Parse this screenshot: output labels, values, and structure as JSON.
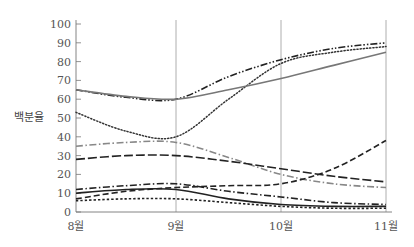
{
  "chart_data": {
    "type": "line",
    "title": "",
    "xlabel": "",
    "ylabel": "백분율",
    "categories": [
      "8월",
      "9월",
      "10월",
      "11월"
    ],
    "ylim": [
      0,
      100
    ],
    "yticks": [
      0,
      10,
      20,
      30,
      40,
      50,
      60,
      70,
      80,
      90,
      100
    ],
    "vertical_gridlines_at": [
      "9월",
      "10월",
      "11월"
    ],
    "legend": "none",
    "series": [
      {
        "name": "series-1",
        "style": "dash-dot-dot",
        "color": "#222222",
        "values": [
          65,
          60,
          81,
          90
        ],
        "mid": [
          [
            0.5,
            61
          ],
          [
            1.5,
            72
          ],
          [
            2.5,
            87
          ]
        ]
      },
      {
        "name": "series-2",
        "style": "dotted",
        "color": "#333333",
        "values": [
          53,
          40,
          79,
          88
        ],
        "mid": [
          [
            0.5,
            43
          ],
          [
            1.5,
            60
          ],
          [
            2.5,
            85
          ]
        ]
      },
      {
        "name": "series-3",
        "style": "solid",
        "color": "#777777",
        "values": [
          65,
          60,
          71,
          85
        ],
        "mid": [
          [
            0.5,
            61.5
          ],
          [
            1.5,
            65
          ],
          [
            2.5,
            78
          ]
        ]
      },
      {
        "name": "series-4",
        "style": "dash-dot",
        "color": "#888888",
        "values": [
          35,
          37,
          20,
          13
        ],
        "mid": [
          [
            0.5,
            37
          ],
          [
            1.5,
            29
          ],
          [
            2.5,
            15
          ]
        ]
      },
      {
        "name": "series-5",
        "style": "long-dash",
        "color": "#222222",
        "values": [
          28,
          30,
          23,
          16
        ],
        "mid": [
          [
            0.5,
            30
          ],
          [
            1.5,
            27
          ],
          [
            2.5,
            19
          ]
        ]
      },
      {
        "name": "series-6",
        "style": "dashed",
        "color": "#222222",
        "values": [
          7,
          13,
          15,
          38
        ],
        "mid": [
          [
            0.5,
            11
          ],
          [
            1.5,
            14
          ],
          [
            2.5,
            23
          ]
        ]
      },
      {
        "name": "series-7",
        "style": "dash-dot",
        "color": "#222222",
        "values": [
          12,
          15,
          8,
          4
        ],
        "mid": [
          [
            0.5,
            14
          ],
          [
            1.5,
            11
          ],
          [
            2.5,
            5
          ]
        ]
      },
      {
        "name": "series-8",
        "style": "solid",
        "color": "#222222",
        "values": [
          10,
          12,
          4,
          3
        ],
        "mid": [
          [
            0.5,
            12
          ],
          [
            1.5,
            7
          ],
          [
            2.5,
            3
          ]
        ]
      },
      {
        "name": "series-9",
        "style": "dotted-square",
        "color": "#222222",
        "values": [
          6,
          7,
          3,
          2
        ],
        "mid": [
          [
            0.5,
            7
          ],
          [
            1.5,
            5
          ],
          [
            2.5,
            2
          ]
        ]
      }
    ]
  }
}
